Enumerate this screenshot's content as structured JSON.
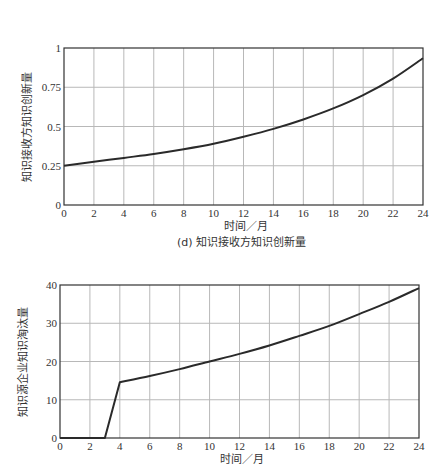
{
  "chart_data": [
    {
      "type": "line",
      "title": "",
      "caption": "(d) 知识接收方知识创新量",
      "xlabel": "时间／月",
      "ylabel": "知识接收方知识创新量",
      "xlim": [
        0,
        24
      ],
      "ylim": [
        0,
        1
      ],
      "xticks": [
        0,
        2,
        4,
        6,
        8,
        10,
        12,
        14,
        16,
        18,
        20,
        22,
        24
      ],
      "yticks": [
        0,
        0.25,
        0.5,
        0.75,
        1
      ],
      "ytick_labels": [
        "0",
        "0.25",
        "0.5",
        "0.75",
        "1"
      ],
      "grid": true,
      "legend": null,
      "x": [
        0,
        2,
        4,
        6,
        8,
        10,
        12,
        14,
        16,
        18,
        20,
        22,
        24
      ],
      "series": [
        {
          "name": "知识接收方知识创新量",
          "values": [
            0.25,
            0.275,
            0.3,
            0.325,
            0.355,
            0.39,
            0.435,
            0.485,
            0.545,
            0.615,
            0.7,
            0.805,
            0.935
          ]
        }
      ],
      "plot_box": {
        "left": 64,
        "top": 48,
        "right": 423,
        "bottom": 205
      }
    },
    {
      "type": "line",
      "title": "",
      "caption": "",
      "xlabel": "时间／月",
      "ylabel": "知识源企业知识淘汰量",
      "xlim": [
        0,
        24
      ],
      "ylim": [
        0,
        40
      ],
      "xticks": [
        0,
        2,
        4,
        6,
        8,
        10,
        12,
        14,
        16,
        18,
        20,
        22,
        24
      ],
      "yticks": [
        0,
        10,
        20,
        30,
        40
      ],
      "ytick_labels": [
        "0",
        "10",
        "20",
        "30",
        "40"
      ],
      "grid": true,
      "legend": null,
      "x": [
        0,
        2,
        3,
        4,
        6,
        8,
        10,
        12,
        14,
        16,
        18,
        20,
        22,
        24
      ],
      "series": [
        {
          "name": "知识源企业知识淘汰量",
          "values": [
            0,
            0,
            0,
            14.6,
            16.2,
            18.0,
            20.0,
            22.0,
            24.2,
            26.7,
            29.3,
            32.4,
            35.6,
            39.2
          ]
        }
      ],
      "plot_box": {
        "left": 60,
        "top": 25,
        "right": 419,
        "bottom": 178
      }
    }
  ]
}
